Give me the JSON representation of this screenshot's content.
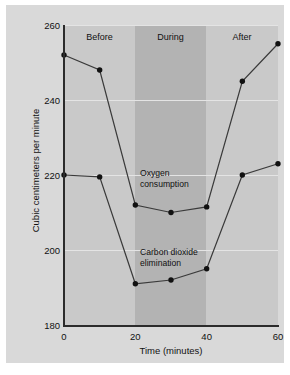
{
  "chart_data": {
    "type": "line",
    "title": "",
    "xlabel": "Time (minutes)",
    "ylabel": "Cubic centimeters per minute",
    "xlim": [
      0,
      60
    ],
    "ylim": [
      180,
      260
    ],
    "xticks": [
      0,
      20,
      40,
      60
    ],
    "yticks": [
      180,
      200,
      220,
      240,
      260
    ],
    "grid": true,
    "legend": "inline-annotations",
    "x": [
      0,
      10,
      20,
      30,
      40,
      50,
      60
    ],
    "series": [
      {
        "name": "Oxygen consumption",
        "values": [
          252,
          248,
          212,
          210,
          211.5,
          245,
          255
        ]
      },
      {
        "name": "Carbon dioxide elimination",
        "values": [
          220,
          219.5,
          191,
          192,
          195,
          220,
          223
        ]
      }
    ],
    "bands": [
      {
        "label": "Before",
        "x_start": 0,
        "x_end": 20
      },
      {
        "label": "During",
        "x_start": 20,
        "x_end": 40
      },
      {
        "label": "After",
        "x_start": 40,
        "x_end": 60
      }
    ],
    "annotations": [
      {
        "text": "Oxygen\nconsumption",
        "x": 22,
        "y": 224
      },
      {
        "text": "Carbon dioxide\nelimination",
        "x": 22,
        "y": 203
      }
    ],
    "colors": {
      "figure_background": "#ffffff",
      "panel_background": "#d9d9d9",
      "plot_background": "#c9c9c9",
      "band_highlight": "#b3b3b3",
      "gridline": "#e4e4e4",
      "axis": "#2b2b2b",
      "line": "#3a3a3a",
      "marker": "#111111",
      "text": "#111111"
    }
  }
}
